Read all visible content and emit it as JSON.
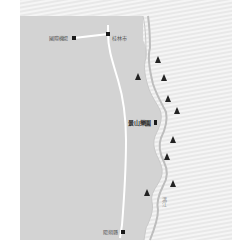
{
  "map": {
    "type": "route-map",
    "colors": {
      "land": "#d4d4d4",
      "water_bg": "#e6e6e6",
      "water_stripe": "#f4f4f4",
      "route": "#ffffff",
      "marker": "#1a1a1a",
      "mountain": "#222222",
      "river_line": "#c8c8c8"
    },
    "places": [
      {
        "name": "國際機場",
        "kind": "airport",
        "x": 74,
        "y": 38
      },
      {
        "name": "桂林市",
        "kind": "city",
        "x": 108,
        "y": 34
      },
      {
        "name": "景山樂園",
        "kind": "attraction",
        "x": 156,
        "y": 124
      },
      {
        "name": "陽朔縣",
        "kind": "county",
        "x": 122,
        "y": 232
      }
    ],
    "river": {
      "name": "漓江"
    },
    "mountains": [
      {
        "x": 158,
        "y": 60
      },
      {
        "x": 138,
        "y": 77
      },
      {
        "x": 164,
        "y": 78
      },
      {
        "x": 168,
        "y": 99
      },
      {
        "x": 177,
        "y": 111
      },
      {
        "x": 173,
        "y": 140
      },
      {
        "x": 167,
        "y": 157
      },
      {
        "x": 173,
        "y": 184
      },
      {
        "x": 147,
        "y": 193
      }
    ]
  }
}
